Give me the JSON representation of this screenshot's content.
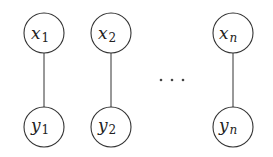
{
  "diagram": {
    "type": "graphical-model",
    "nodes": [
      {
        "id": "x1",
        "var": "x",
        "sub": "1",
        "cx": 44,
        "cy": 33,
        "r": 20
      },
      {
        "id": "x2",
        "var": "x",
        "sub": "2",
        "cx": 111,
        "cy": 33,
        "r": 20
      },
      {
        "id": "xn",
        "var": "x",
        "sub": "n",
        "cx": 233,
        "cy": 33,
        "r": 20
      },
      {
        "id": "y1",
        "var": "y",
        "sub": "1",
        "cx": 44,
        "cy": 127,
        "r": 20
      },
      {
        "id": "y2",
        "var": "y",
        "sub": "2",
        "cx": 111,
        "cy": 127,
        "r": 20
      },
      {
        "id": "yn",
        "var": "y",
        "sub": "n",
        "cx": 233,
        "cy": 127,
        "r": 20
      }
    ],
    "edges": [
      {
        "from": "x1",
        "to": "y1"
      },
      {
        "from": "x2",
        "to": "y2"
      },
      {
        "from": "xn",
        "to": "yn"
      }
    ],
    "ellipsis": "⋯",
    "colors": {
      "stroke": "#333333",
      "text": "#222222",
      "background": "#ffffff"
    }
  }
}
